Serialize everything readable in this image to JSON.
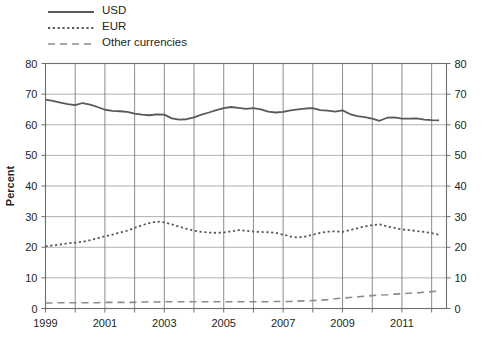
{
  "chart_data": {
    "type": "line",
    "title": "",
    "xlabel": "",
    "ylabel": "Percent",
    "ylim": [
      0,
      80
    ],
    "ytick_step": 10,
    "xlim": [
      1999,
      2012.5
    ],
    "xticks": [
      1999,
      2001,
      2003,
      2005,
      2007,
      2009,
      2011
    ],
    "xtick_labels": [
      "1999",
      "2001",
      "2003",
      "2005",
      "2007",
      "2009",
      "2011"
    ],
    "yticks": [
      0,
      10,
      20,
      30,
      40,
      50,
      60,
      70,
      80
    ],
    "ytick_labels": [
      "0",
      "10",
      "20",
      "30",
      "40",
      "50",
      "60",
      "70",
      "80"
    ],
    "grid": "both",
    "dual_y_axis": true,
    "legend_position": "above-plot-left",
    "x": [
      1999.0,
      1999.25,
      1999.5,
      1999.75,
      2000.0,
      2000.25,
      2000.5,
      2000.75,
      2001.0,
      2001.25,
      2001.5,
      2001.75,
      2002.0,
      2002.25,
      2002.5,
      2002.75,
      2003.0,
      2003.25,
      2003.5,
      2003.75,
      2004.0,
      2004.25,
      2004.5,
      2004.75,
      2005.0,
      2005.25,
      2005.5,
      2005.75,
      2006.0,
      2006.25,
      2006.5,
      2006.75,
      2007.0,
      2007.25,
      2007.5,
      2007.75,
      2008.0,
      2008.25,
      2008.5,
      2008.75,
      2009.0,
      2009.25,
      2009.5,
      2009.75,
      2010.0,
      2010.25,
      2010.5,
      2010.75,
      2011.0,
      2011.25,
      2011.5,
      2011.75,
      2012.0,
      2012.25
    ],
    "series": [
      {
        "name": "USD",
        "style": "solid",
        "color": "#58595b",
        "values": [
          68.2,
          67.8,
          67.2,
          66.7,
          66.4,
          67.1,
          66.6,
          65.8,
          64.9,
          64.5,
          64.4,
          64.2,
          63.6,
          63.3,
          63.1,
          63.4,
          63.3,
          62.1,
          61.7,
          61.8,
          62.4,
          63.3,
          64.0,
          64.8,
          65.4,
          65.8,
          65.5,
          65.2,
          65.4,
          65.0,
          64.3,
          64.0,
          64.2,
          64.7,
          65.0,
          65.3,
          65.4,
          64.8,
          64.6,
          64.3,
          64.7,
          63.5,
          62.8,
          62.5,
          62.0,
          61.3,
          62.3,
          62.4,
          62.0,
          62.0,
          62.1,
          61.7,
          61.5,
          61.4
        ]
      },
      {
        "name": "EUR",
        "style": "dotted",
        "color": "#58595b",
        "values": [
          20.3,
          20.6,
          20.9,
          21.3,
          21.5,
          21.8,
          22.3,
          22.9,
          23.6,
          24.1,
          24.8,
          25.4,
          26.3,
          27.2,
          27.9,
          28.4,
          28.1,
          27.5,
          26.7,
          26.0,
          25.4,
          25.0,
          24.8,
          24.7,
          24.8,
          25.2,
          25.6,
          25.4,
          25.1,
          25.0,
          24.9,
          24.7,
          24.1,
          23.5,
          23.2,
          23.5,
          24.1,
          24.7,
          25.1,
          25.2,
          25.0,
          25.6,
          26.2,
          26.8,
          27.2,
          27.5,
          26.8,
          26.3,
          25.8,
          25.6,
          25.3,
          25.0,
          24.6,
          24.1
        ]
      },
      {
        "name": "Other currencies",
        "style": "dashed",
        "color": "#8c8c8c",
        "values": [
          1.8,
          1.8,
          1.9,
          1.9,
          1.9,
          1.9,
          1.9,
          1.9,
          2.0,
          2.0,
          2.0,
          2.0,
          2.0,
          2.1,
          2.1,
          2.1,
          2.2,
          2.2,
          2.2,
          2.2,
          2.2,
          2.2,
          2.2,
          2.2,
          2.2,
          2.2,
          2.2,
          2.2,
          2.2,
          2.2,
          2.2,
          2.3,
          2.3,
          2.3,
          2.4,
          2.5,
          2.6,
          2.7,
          2.9,
          3.2,
          3.4,
          3.6,
          3.8,
          4.0,
          4.2,
          4.4,
          4.5,
          4.7,
          4.8,
          5.0,
          5.1,
          5.3,
          5.5,
          5.7
        ]
      }
    ]
  },
  "legend": {
    "items": [
      {
        "label": "USD",
        "style": "solid"
      },
      {
        "label": "EUR",
        "style": "dotted"
      },
      {
        "label": "Other currencies",
        "style": "dashed"
      }
    ]
  }
}
